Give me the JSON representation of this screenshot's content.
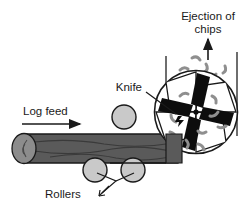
{
  "diagram": {
    "labels": {
      "ejection_line1": "Ejection of",
      "ejection_line2": "chips",
      "knife": "Knife",
      "log_feed": "Log feed",
      "rollers": "Rollers"
    },
    "colors": {
      "log_body": "#5a5a5a",
      "log_end": "#8c8c8c",
      "log_grain": "#3f3f3f",
      "roller_fill": "#c9c9c9",
      "blade": "#0d0d0d",
      "chip": "#8f8f8f",
      "outline": "#1a1a1a",
      "background": "#ffffff"
    },
    "parts": {
      "cutter_head": {
        "name": "rotating cutter head",
        "center_x": 196,
        "center_y": 112,
        "radius": 42,
        "blade_count": 4,
        "hub_marker": "center-dot"
      },
      "rollers": [
        {
          "name": "top-roller",
          "cx": 124,
          "cy": 117,
          "r": 12
        },
        {
          "name": "bottom-roller-left",
          "cx": 95,
          "cy": 170,
          "r": 12
        },
        {
          "name": "bottom-roller-right",
          "cx": 133,
          "cy": 170,
          "r": 12
        }
      ],
      "log": {
        "name": "log",
        "left_x": 12,
        "right_x": 178,
        "top_y": 134,
        "bottom_y": 163
      },
      "feed_arrow": {
        "from_x": 22,
        "to_x": 80,
        "y": 124,
        "direction": "right"
      },
      "ejection_arrow": {
        "x": 208,
        "from_y": 58,
        "to_y": 38,
        "direction": "up"
      },
      "chip_count": 18
    }
  }
}
